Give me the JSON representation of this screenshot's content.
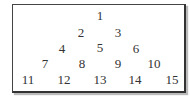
{
  "diagram": {
    "title": "",
    "rows": [
      [
        "1"
      ],
      [
        "2",
        "3"
      ],
      [
        "4",
        "5",
        "6"
      ],
      [
        "7",
        "8",
        "9",
        "10"
      ],
      [
        "11",
        "12",
        "13",
        "14",
        "15"
      ]
    ]
  }
}
